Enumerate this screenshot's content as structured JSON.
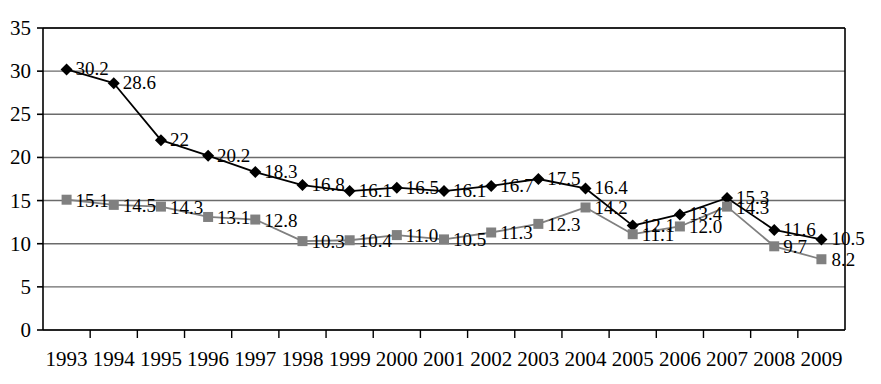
{
  "chart_data": {
    "type": "line",
    "title": "",
    "subtitle": "",
    "xlabel": "",
    "ylabel": "",
    "categories": [
      "1993",
      "1994",
      "1995",
      "1996",
      "1997",
      "1998",
      "1999",
      "2000",
      "2001",
      "2002",
      "2003",
      "2004",
      "2005",
      "2006",
      "2007",
      "2008",
      "2009"
    ],
    "ylim": [
      0,
      35
    ],
    "yticks": [
      "0",
      "5",
      "10",
      "15",
      "20",
      "25",
      "30",
      "35"
    ],
    "ytick_values": [
      0,
      5,
      10,
      15,
      20,
      25,
      30,
      35
    ],
    "grid": "horizontal",
    "legend": "none",
    "series": [
      {
        "name": "series-dark",
        "color": "#000000",
        "marker": "diamond",
        "values": [
          30.2,
          28.6,
          22,
          20.2,
          18.3,
          16.8,
          16.1,
          16.5,
          16.1,
          16.7,
          17.5,
          16.4,
          12.1,
          13.4,
          15.3,
          11.6,
          10.5
        ],
        "labels": [
          "30.2",
          "28.6",
          "22",
          "20.2",
          "18.3",
          "16.8",
          "16.1",
          "16.5",
          "16.1",
          "16.7",
          "17.5",
          "16.4",
          "12.1",
          "13.4",
          "15.3",
          "11.6",
          "10.5"
        ]
      },
      {
        "name": "series-gray",
        "color": "#808080",
        "marker": "square",
        "values": [
          15.1,
          14.5,
          14.3,
          13.1,
          12.8,
          10.3,
          10.4,
          11.0,
          10.5,
          11.3,
          12.3,
          14.2,
          11.1,
          12.0,
          14.3,
          9.7,
          8.2
        ],
        "labels": [
          "15.1",
          "14.5",
          "14.3",
          "13.1",
          "12.8",
          "10.3",
          "10.4",
          "11.0",
          "10.5",
          "11.3",
          "12.3",
          "14.2",
          "11.1",
          "12.0",
          "14.3",
          "9.7",
          "8.2"
        ]
      }
    ]
  },
  "colors": {
    "dark_series": "#000000",
    "gray_series": "#808080",
    "grid": "#6b6b6b",
    "axis": "#000000",
    "background": "#ffffff"
  }
}
